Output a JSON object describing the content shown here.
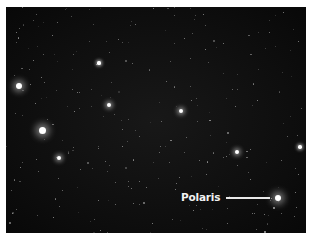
{
  "image": {
    "subject": "star field",
    "background_color": "#0f0f0f",
    "frame_color": "#ffffff"
  },
  "annotation": {
    "label": "Polaris",
    "target_star": {
      "x": 278,
      "y": 198
    }
  },
  "bright_stars": [
    {
      "x": 19,
      "y": 86,
      "r": 3.2,
      "glow": 6
    },
    {
      "x": 42,
      "y": 130,
      "r": 3.5,
      "glow": 7
    },
    {
      "x": 59,
      "y": 158,
      "r": 2,
      "glow": 4
    },
    {
      "x": 109,
      "y": 105,
      "r": 2.2,
      "glow": 4
    },
    {
      "x": 181,
      "y": 111,
      "r": 2,
      "glow": 4
    },
    {
      "x": 99,
      "y": 63,
      "r": 1.6,
      "glow": 3
    },
    {
      "x": 237,
      "y": 152,
      "r": 2,
      "glow": 4
    },
    {
      "x": 300,
      "y": 147,
      "r": 1.8,
      "glow": 3
    },
    {
      "x": 278,
      "y": 198,
      "r": 3,
      "glow": 7
    }
  ]
}
